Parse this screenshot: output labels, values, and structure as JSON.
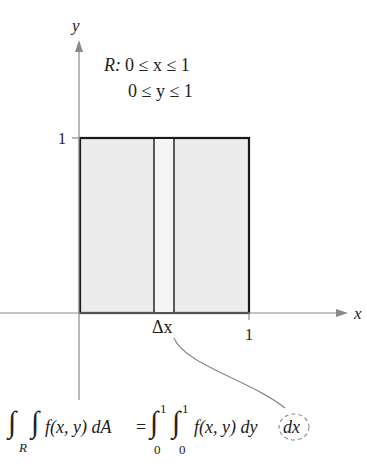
{
  "diagram": {
    "axes": {
      "x_label": "x",
      "y_label": "y",
      "x_tick": "1",
      "y_tick": "1"
    },
    "region": {
      "name": "R",
      "line1_prefix": "R:",
      "line1": "0 ≤ x ≤ 1",
      "line2": "0 ≤ y ≤ 1"
    },
    "strip_label": "Δx",
    "formula": {
      "lhs_subscript": "R",
      "lhs_integrand": "f(x, y) dA",
      "equals": "=",
      "upper1": "1",
      "lower1": "0",
      "upper2": "1",
      "lower2": "0",
      "rhs_integrand": "f(x, y) dy",
      "highlighted": "dx"
    },
    "colors": {
      "fill": "#ececec",
      "stroke": "#1a1a1a",
      "axis": "#8a8a8a"
    }
  }
}
